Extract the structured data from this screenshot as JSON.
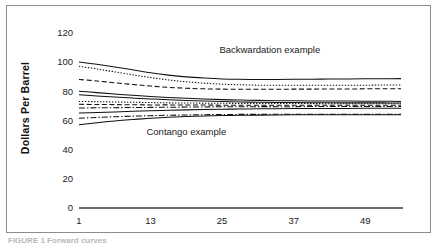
{
  "figure": {
    "caption_partial": "FIGURE 1 Forward curves"
  },
  "chart_data": {
    "type": "line",
    "title": "",
    "xlabel": "",
    "ylabel": "Dollars Per Barrel",
    "xlim": [
      1,
      55
    ],
    "ylim": [
      0,
      126
    ],
    "grid": false,
    "legend": "none",
    "xticks": [
      1,
      13,
      25,
      37,
      49
    ],
    "xtick_labels": [
      "1",
      "13",
      "25",
      "37",
      "49"
    ],
    "yticks": [
      0,
      20,
      40,
      60,
      80,
      100,
      120
    ],
    "ytick_labels": [
      "0",
      "20",
      "40",
      "60",
      "80",
      "100",
      "120"
    ],
    "annotations": [
      {
        "text": "Backwardation example",
        "x": 33,
        "y": 106
      },
      {
        "text": "Contango example",
        "x": 19,
        "y": 50
      }
    ],
    "x": [
      1,
      4,
      7,
      10,
      13,
      16,
      19,
      22,
      25,
      28,
      31,
      34,
      37,
      40,
      43,
      46,
      49,
      52,
      55
    ],
    "series": [
      {
        "name": "backwardation-solid",
        "group": "backwardation",
        "style": "solid",
        "values": [
          100.0,
          98.4,
          96.6,
          94.6,
          92.6,
          91.0,
          89.8,
          89.0,
          88.4,
          88.1,
          88.0,
          88.0,
          88.1,
          88.2,
          88.3,
          88.4,
          88.5,
          88.5,
          88.6
        ]
      },
      {
        "name": "backwardation-dotted",
        "group": "backwardation",
        "style": "dotted",
        "values": [
          97.0,
          95.2,
          93.2,
          91.2,
          89.3,
          87.7,
          86.4,
          85.5,
          84.8,
          84.4,
          84.1,
          84.0,
          84.0,
          84.0,
          84.0,
          84.1,
          84.1,
          84.2,
          84.2
        ]
      },
      {
        "name": "backwardation-dashed",
        "group": "backwardation",
        "style": "dashed",
        "values": [
          88.0,
          87.0,
          85.8,
          84.6,
          83.5,
          82.6,
          82.0,
          81.6,
          81.4,
          81.3,
          81.3,
          81.3,
          81.4,
          81.4,
          81.5,
          81.5,
          81.6,
          81.6,
          81.7
        ]
      },
      {
        "name": "contango-solid-upper",
        "group": "contango",
        "style": "solid",
        "values": [
          80.0,
          79.0,
          78.0,
          77.2,
          76.4,
          75.7,
          75.1,
          74.6,
          74.2,
          73.9,
          73.7,
          73.5,
          73.4,
          73.3,
          73.2,
          73.2,
          73.1,
          73.1,
          73.0
        ]
      },
      {
        "name": "contango-solid-upper-2",
        "group": "contango",
        "style": "solid",
        "values": [
          77.5,
          76.7,
          76.0,
          75.3,
          74.7,
          74.1,
          73.6,
          73.2,
          72.9,
          72.6,
          72.4,
          72.3,
          72.2,
          72.1,
          72.1,
          72.0,
          72.0,
          72.0,
          71.9
        ]
      },
      {
        "name": "contango-dotted-upper",
        "group": "contango",
        "style": "dotted",
        "values": [
          73.0,
          72.8,
          72.6,
          72.4,
          72.2,
          72.0,
          71.9,
          71.8,
          71.7,
          71.6,
          71.6,
          71.5,
          71.5,
          71.5,
          71.4,
          71.4,
          71.4,
          71.4,
          71.4
        ]
      },
      {
        "name": "contango-dashed-mid",
        "group": "contango",
        "style": "dashed",
        "values": [
          71.0,
          70.9,
          70.8,
          70.7,
          70.6,
          70.6,
          70.5,
          70.5,
          70.4,
          70.4,
          70.4,
          70.4,
          70.4,
          70.4,
          70.3,
          70.3,
          70.3,
          70.3,
          70.3
        ]
      },
      {
        "name": "contango-dashdot-mid",
        "group": "contango",
        "style": "dashdot",
        "values": [
          68.5,
          68.6,
          68.7,
          68.8,
          68.9,
          69.0,
          69.1,
          69.2,
          69.3,
          69.3,
          69.4,
          69.4,
          69.4,
          69.5,
          69.5,
          69.5,
          69.5,
          69.5,
          69.5
        ]
      },
      {
        "name": "contango-solid-lower",
        "group": "contango",
        "style": "solid",
        "values": [
          65.0,
          65.4,
          65.8,
          66.2,
          66.6,
          66.9,
          67.2,
          67.4,
          67.6,
          67.8,
          67.9,
          68.0,
          68.1,
          68.1,
          68.2,
          68.2,
          68.3,
          68.3,
          68.3
        ]
      },
      {
        "name": "contango-dashdot-lower",
        "group": "contango",
        "style": "dashdot",
        "values": [
          61.5,
          62.0,
          62.5,
          62.9,
          63.2,
          63.5,
          63.7,
          63.9,
          64.0,
          64.1,
          64.1,
          64.2,
          64.2,
          64.2,
          64.2,
          64.2,
          64.2,
          64.2,
          64.2
        ]
      },
      {
        "name": "contango-solid-bottom",
        "group": "contango",
        "style": "solid",
        "values": [
          57.0,
          58.4,
          59.6,
          60.6,
          61.4,
          62.1,
          62.6,
          63.0,
          63.3,
          63.5,
          63.6,
          63.7,
          63.8,
          63.8,
          63.8,
          63.8,
          63.8,
          63.8,
          63.8
        ]
      }
    ]
  }
}
